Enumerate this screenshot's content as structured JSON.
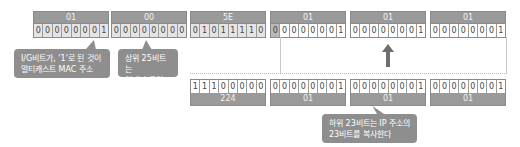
{
  "mac_address": {
    "bytes": [
      {
        "hex": "01",
        "bits": [
          "0",
          "0",
          "0",
          "0",
          "0",
          "0",
          "0",
          "1"
        ]
      },
      {
        "hex": "00",
        "bits": [
          "0",
          "0",
          "0",
          "0",
          "0",
          "0",
          "0",
          "0"
        ]
      },
      {
        "hex": "5E",
        "bits": [
          "0",
          "1",
          "0",
          "1",
          "1",
          "1",
          "1",
          "0"
        ]
      },
      {
        "hex": "01",
        "bits": [
          "0",
          "0",
          "0",
          "0",
          "0",
          "0",
          "0",
          "1"
        ]
      },
      {
        "hex": "01",
        "bits": [
          "0",
          "0",
          "0",
          "0",
          "0",
          "0",
          "0",
          "1"
        ]
      },
      {
        "hex": "01",
        "bits": [
          "0",
          "0",
          "0",
          "0",
          "0",
          "0",
          "0",
          "1"
        ]
      }
    ]
  },
  "ip_address": {
    "bytes": [
      {
        "dec": "224",
        "bits": [
          "1",
          "1",
          "1",
          "0",
          "0",
          "0",
          "0",
          "0"
        ]
      },
      {
        "dec": "01",
        "bits": [
          "0",
          "0",
          "0",
          "0",
          "0",
          "0",
          "0",
          "1"
        ]
      },
      {
        "dec": "01",
        "bits": [
          "0",
          "0",
          "0",
          "0",
          "0",
          "0",
          "0",
          "1"
        ]
      },
      {
        "dec": "01",
        "bits": [
          "0",
          "0",
          "0",
          "0",
          "0",
          "0",
          "0",
          "1"
        ]
      }
    ]
  },
  "callouts": {
    "ig_bit": {
      "line1": "I/G비트가, '1'로 된 것이",
      "line2": "멀티캐스트 MAC 주소"
    },
    "upper25": {
      "line1": "상위 25비트는",
      "line2": "언제나 동일"
    },
    "lower23": {
      "line1": "하위 23비트는 IP 주소의",
      "line2": "23비트를 복사한다"
    }
  },
  "colors": {
    "header_gray": "#9a9a9a",
    "callout_gray": "#8e8e8e",
    "arrow": "#6e6e6e",
    "shaded_bits": "#e4e4e4"
  }
}
